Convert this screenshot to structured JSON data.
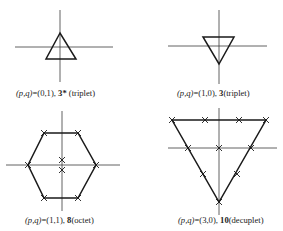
{
  "diagrams": [
    {
      "id": "triplet-3star",
      "caption": {
        "pq_label": "(p,q)",
        "eq": "=(0,1), ",
        "rep": "3*",
        "name": " (triplet)"
      },
      "axes": {
        "h": [
          15,
          47,
          113,
          47
        ],
        "v": [
          60,
          10,
          60,
          82
        ]
      },
      "shape": "triangle-up",
      "points": "60,33 46,59 76,59",
      "crosses": []
    },
    {
      "id": "triplet-3",
      "caption": {
        "pq_label": "(p,q)",
        "eq": "=(1,0), ",
        "rep": "3",
        "name": "(triplet)"
      },
      "axes": {
        "h": [
          168,
          46,
          267,
          46
        ],
        "v": [
          219,
          10,
          219,
          84
        ]
      },
      "shape": "triangle-down",
      "points": "203,37 234,37 219,64",
      "crosses": []
    },
    {
      "id": "octet-8",
      "caption": {
        "pq_label": "(p,q)",
        "eq": "=(1,1), ",
        "rep": "8",
        "name": "(octet)"
      },
      "axes": {
        "h": [
          6,
          165,
          120,
          165
        ],
        "v": [
          62,
          111,
          62,
          211
        ]
      },
      "shape": "hexagon",
      "points": "44,133 78,133 96,165 78,198 44,198 28,165",
      "crosses": [
        [
          44,
          133
        ],
        [
          78,
          133
        ],
        [
          96,
          165
        ],
        [
          78,
          198
        ],
        [
          44,
          198
        ],
        [
          28,
          165
        ],
        [
          62,
          160
        ],
        [
          62,
          170
        ]
      ]
    },
    {
      "id": "decuplet-10",
      "caption": {
        "pq_label": "(p,q)",
        "eq": "=(3,0), ",
        "rep": "10",
        "name": "(decuplet)"
      },
      "axes": {
        "h": [
          168,
          148,
          277,
          148
        ],
        "v": [
          219,
          108,
          219,
          215
        ]
      },
      "shape": "triangle-down",
      "points": "172,120 266,120 219,202",
      "crosses": [
        [
          172,
          120
        ],
        [
          205,
          120
        ],
        [
          239,
          120
        ],
        [
          266,
          120
        ],
        [
          188,
          148
        ],
        [
          219,
          148
        ],
        [
          251,
          148
        ],
        [
          203,
          174
        ],
        [
          237,
          174
        ],
        [
          219,
          202
        ]
      ]
    }
  ]
}
